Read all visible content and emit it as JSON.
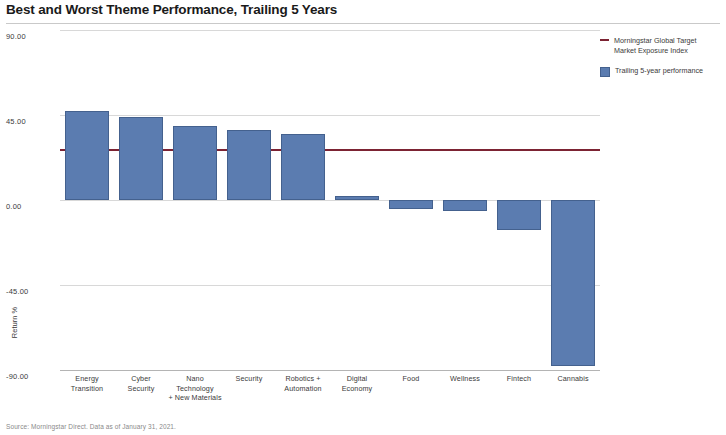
{
  "chart_data": {
    "type": "bar",
    "title": "Best and Worst Theme Performance, Trailing 5 Years",
    "xlabel": "",
    "ylabel": "Return %",
    "ylim": [
      -90,
      90
    ],
    "yticks": [
      "90.00",
      "45.00",
      "0.00",
      "-45.00",
      "-90.00"
    ],
    "ytick_values": [
      90,
      45,
      0,
      -45,
      -90
    ],
    "grid": true,
    "categories": [
      "Energy Transition",
      "Cyber Security",
      "Nano Technology + New Materials",
      "Security",
      "Robotics + Automation",
      "Digital Economy",
      "Food",
      "Wellness",
      "Fintech",
      "Cannabis"
    ],
    "category_lines": [
      [
        "Energy",
        "Transition"
      ],
      [
        "Cyber",
        "Security"
      ],
      [
        "Nano",
        "Technology",
        "+ New Materials"
      ],
      [
        "Security"
      ],
      [
        "Robotics +",
        "Automation"
      ],
      [
        "Digital",
        "Economy"
      ],
      [
        "Food"
      ],
      [
        "Wellness"
      ],
      [
        "Fintech"
      ],
      [
        "Cannabis"
      ]
    ],
    "series": [
      {
        "name": "Trailing 5-year performance",
        "color": "#5b7cb0",
        "values": [
          47,
          44,
          39,
          37,
          35,
          2,
          -5,
          -6,
          -16,
          -88
        ]
      }
    ],
    "reference_line": {
      "name": "Morningstar Global Target Market Exposure Index",
      "color": "#7c2333",
      "value": 27
    },
    "legend_position": "right",
    "legend": [
      {
        "marker": "line",
        "label": "Morningstar Global Target Market Exposure Index",
        "lines": [
          "Morningstar Global Target",
          "Market Exposure Index"
        ],
        "color": "#7c2333"
      },
      {
        "marker": "box",
        "label": "Trailing 5-year performance",
        "lines": [
          "Trailing 5-year performance"
        ],
        "color": "#5b7cb0"
      }
    ],
    "source": "Source: Morningstar Direct. Data as of January 31, 2021."
  }
}
